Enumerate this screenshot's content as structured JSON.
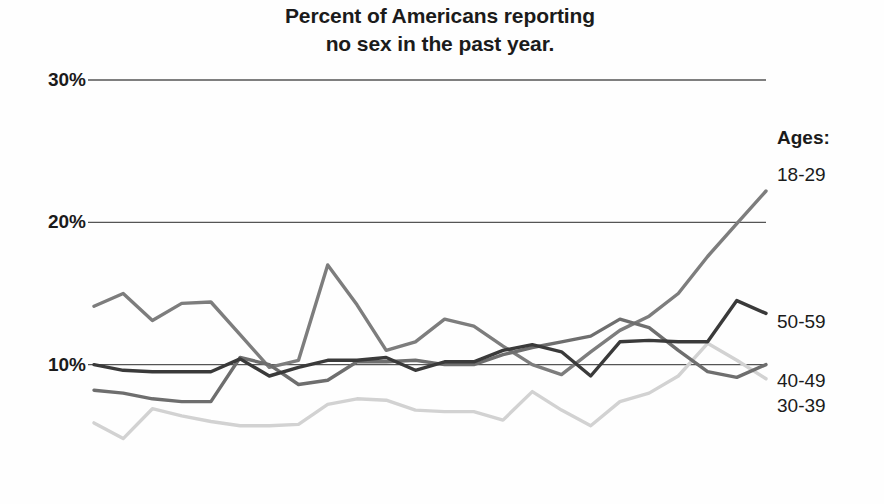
{
  "chart_data": {
    "type": "line",
    "title": "Percent of Americans reporting no sex in the past year.",
    "title_lines": [
      "Percent of Americans reporting",
      "no sex in the past year."
    ],
    "xlabel": "",
    "ylabel": "",
    "ylim": [
      0,
      30
    ],
    "yticks": [
      30,
      20,
      10
    ],
    "ytick_labels": [
      "30%",
      "20%",
      "10%"
    ],
    "grid": true,
    "grid_axis": "y",
    "x_axis_visible": false,
    "xtick_labels": [],
    "legend_position": "right-of-plot-line-end",
    "legend_title": "Ages:",
    "n_points": 24,
    "series": [
      {
        "name": "18-29",
        "color": "#7d7d7d",
        "values": [
          14.1,
          15.0,
          13.1,
          14.3,
          14.4,
          12.1,
          9.8,
          10.3,
          17.0,
          14.2,
          11.0,
          11.6,
          13.2,
          12.7,
          11.3,
          10.0,
          9.3,
          10.9,
          12.4,
          13.4,
          15.0,
          17.6,
          19.9,
          22.2
        ]
      },
      {
        "name": "50-59",
        "color": "#3a3a3a",
        "values": [
          10.0,
          9.6,
          9.5,
          9.5,
          9.5,
          10.4,
          9.2,
          9.8,
          10.3,
          10.3,
          10.5,
          9.6,
          10.2,
          10.2,
          11.0,
          11.4,
          10.9,
          9.2,
          11.6,
          11.7,
          11.6,
          11.6,
          14.5,
          13.6
        ]
      },
      {
        "name": "40-49",
        "color": "#6e6e6e",
        "values": [
          8.2,
          8.0,
          7.6,
          7.4,
          7.4,
          10.5,
          10.0,
          8.6,
          8.9,
          10.2,
          10.2,
          10.3,
          10.0,
          10.0,
          10.7,
          11.2,
          11.6,
          12.0,
          13.2,
          12.6,
          11.0,
          9.5,
          9.1,
          10.0
        ]
      },
      {
        "name": "30-39",
        "color": "#d2d2d2",
        "values": [
          5.9,
          4.8,
          6.9,
          6.4,
          6.0,
          5.7,
          5.7,
          5.8,
          7.2,
          7.6,
          7.5,
          6.8,
          6.7,
          6.7,
          6.1,
          8.1,
          6.8,
          5.7,
          7.4,
          8.0,
          9.2,
          11.5,
          10.3,
          9.0
        ]
      }
    ]
  },
  "axis": {
    "ytick_0": "30%",
    "ytick_1": "20%",
    "ytick_2": "10%"
  },
  "legend": {
    "title": "Ages:",
    "items": [
      {
        "label": "18-29"
      },
      {
        "label": "50-59"
      },
      {
        "label": "40-49"
      },
      {
        "label": "30-39"
      }
    ]
  }
}
